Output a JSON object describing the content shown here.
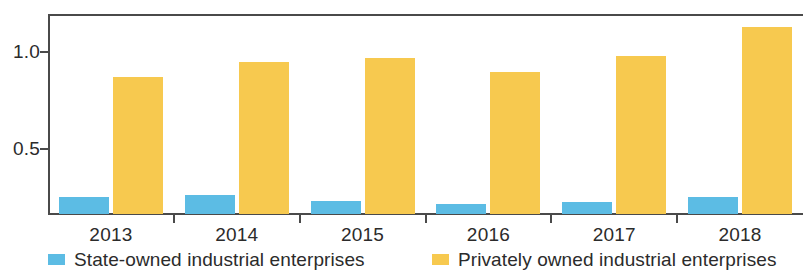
{
  "chart_data": {
    "type": "bar",
    "title": "",
    "xlabel": "",
    "ylabel": "",
    "categories": [
      "2013",
      "2014",
      "2015",
      "2016",
      "2017",
      "2018"
    ],
    "series": [
      {
        "name": "State-owned industrial enterprises",
        "color": "#5cbce4",
        "values": [
          0.25,
          0.26,
          0.23,
          0.21,
          0.22,
          0.25
        ]
      },
      {
        "name": "Privately owned industrial enterprises",
        "color": "#f7c94f",
        "values": [
          0.87,
          0.95,
          0.97,
          0.9,
          0.98,
          1.13
        ]
      }
    ],
    "yticks": [
      0.5,
      1.0
    ],
    "ytick_labels": [
      "0.5",
      "1.0"
    ],
    "ylim": [
      0.16,
      1.2
    ],
    "grid": false,
    "legend_position": "bottom",
    "axis_color": "#4a4a4a"
  },
  "legend": {
    "items": [
      {
        "label": "State-owned industrial enterprises",
        "swatch": "blue-swatch"
      },
      {
        "label": "Privately owned industrial enterprises",
        "swatch": "yellow-swatch"
      }
    ]
  }
}
